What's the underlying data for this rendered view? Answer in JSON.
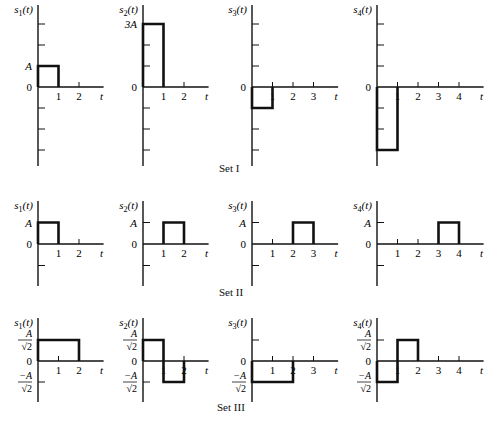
{
  "chart_data": [
    {
      "type": "line",
      "title": "Set I",
      "xlabel": "t",
      "unit_label": "A",
      "series": [
        {
          "name": "s1(t)",
          "segments": [
            [
              0,
              1,
              1
            ]
          ],
          "yticks_labels": [
            {
              "v": 1,
              "label": "A"
            },
            {
              "v": 0,
              "label": "0"
            }
          ],
          "xticks": [
            1,
            2
          ],
          "ylim": [
            -4,
            4
          ],
          "xmax": 2
        },
        {
          "name": "s2(t)",
          "segments": [
            [
              0,
              1,
              3
            ]
          ],
          "yticks_labels": [
            {
              "v": 3,
              "label": "3A"
            },
            {
              "v": 0,
              "label": "0"
            }
          ],
          "xticks": [
            1,
            2
          ],
          "ylim": [
            -4,
            4
          ],
          "xmax": 2
        },
        {
          "name": "s3(t)",
          "segments": [
            [
              0,
              1,
              -1
            ]
          ],
          "yticks_labels": [
            {
              "v": 0,
              "label": "0"
            }
          ],
          "xticks": [
            1,
            2,
            3
          ],
          "ylim": [
            -4,
            4
          ],
          "xmax": 3
        },
        {
          "name": "s4(t)",
          "segments": [
            [
              0,
              1,
              -3
            ]
          ],
          "yticks_labels": [
            {
              "v": 0,
              "label": "0"
            }
          ],
          "xticks": [
            1,
            2,
            3,
            4
          ],
          "ylim": [
            -4,
            4
          ],
          "xmax": 4
        }
      ]
    },
    {
      "type": "line",
      "title": "Set II",
      "xlabel": "t",
      "series": [
        {
          "name": "s1(t)",
          "segments": [
            [
              0,
              1,
              1
            ]
          ],
          "yticks_labels": [
            {
              "v": 1,
              "label": "A"
            },
            {
              "v": 0,
              "label": "0"
            }
          ],
          "xticks": [
            1,
            2
          ],
          "ylim": [
            -2,
            2
          ],
          "xmax": 2
        },
        {
          "name": "s2(t)",
          "segments": [
            [
              1,
              2,
              1
            ]
          ],
          "yticks_labels": [
            {
              "v": 1,
              "label": "A"
            },
            {
              "v": 0,
              "label": "0"
            }
          ],
          "xticks": [
            1,
            2
          ],
          "ylim": [
            -2,
            2
          ],
          "xmax": 2
        },
        {
          "name": "s3(t)",
          "segments": [
            [
              2,
              3,
              1
            ]
          ],
          "yticks_labels": [
            {
              "v": 1,
              "label": "A"
            },
            {
              "v": 0,
              "label": "0"
            }
          ],
          "xticks": [
            1,
            2,
            3
          ],
          "ylim": [
            -2,
            2
          ],
          "xmax": 3
        },
        {
          "name": "s4(t)",
          "segments": [
            [
              3,
              4,
              1
            ]
          ],
          "yticks_labels": [
            {
              "v": 1,
              "label": "A"
            },
            {
              "v": 0,
              "label": "0"
            }
          ],
          "xticks": [
            1,
            2,
            3,
            4
          ],
          "ylim": [
            -2,
            2
          ],
          "xmax": 4
        }
      ]
    },
    {
      "type": "line",
      "title": "Set III",
      "xlabel": "t",
      "series": [
        {
          "name": "s1(t)",
          "segments": [
            [
              0,
              2,
              1
            ]
          ],
          "yticks_labels": [
            {
              "v": 1,
              "label": "A/√2"
            },
            {
              "v": 0,
              "label": "0"
            },
            {
              "v": -1,
              "label": "-A/√2"
            }
          ],
          "xticks": [
            1,
            2
          ],
          "ylim": [
            -2,
            2
          ],
          "xmax": 2
        },
        {
          "name": "s2(t)",
          "segments": [
            [
              0,
              1,
              1
            ],
            [
              1,
              2,
              -1
            ]
          ],
          "yticks_labels": [
            {
              "v": 1,
              "label": "A/√2"
            },
            {
              "v": 0,
              "label": "0"
            },
            {
              "v": -1,
              "label": "-A/√2"
            }
          ],
          "xticks": [
            1,
            2
          ],
          "ylim": [
            -2,
            2
          ],
          "xmax": 2
        },
        {
          "name": "s3(t)",
          "segments": [
            [
              0,
              2,
              -1
            ]
          ],
          "yticks_labels": [
            {
              "v": 0,
              "label": "0"
            },
            {
              "v": -1,
              "label": "-A/√2"
            }
          ],
          "xticks": [
            1,
            2,
            3
          ],
          "ylim": [
            -2,
            2
          ],
          "xmax": 3
        },
        {
          "name": "s4(t)",
          "segments": [
            [
              0,
              1,
              -1
            ],
            [
              1,
              2,
              1
            ]
          ],
          "yticks_labels": [
            {
              "v": 1,
              "label": "A/√2"
            },
            {
              "v": 0,
              "label": "0"
            },
            {
              "v": -1,
              "label": "-A/√2"
            }
          ],
          "xticks": [
            1,
            2,
            3,
            4
          ],
          "ylim": [
            -2,
            2
          ],
          "xmax": 4
        }
      ]
    }
  ],
  "labels": {
    "set1": "Set I",
    "set2": "Set II",
    "set3": "Set III"
  }
}
